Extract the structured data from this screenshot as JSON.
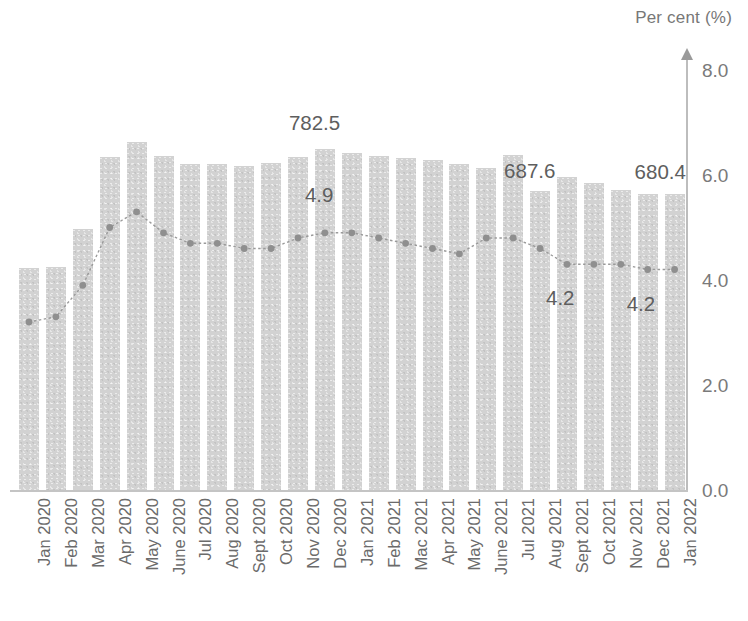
{
  "chart": {
    "y_axis_title": "Per cent (%)",
    "y_ticks": [
      "8.0",
      "6.0",
      "4.0",
      "2.0",
      "0.0"
    ]
  },
  "chart_data": {
    "type": "bar",
    "title": "",
    "subtitle": "",
    "xlabel": "",
    "ylabel": "Per cent (%)",
    "ylim": [
      0.0,
      8.0
    ],
    "yticks": [
      0.0,
      2.0,
      4.0,
      6.0,
      8.0
    ],
    "grid": false,
    "legend": null,
    "categories": [
      "Jan 2020",
      "Feb 2020",
      "Mar 2020",
      "Apr 2020",
      "May 2020",
      "June 2020",
      "Jul 2020",
      "Aug 2020",
      "Sept 2020",
      "Oct 2020",
      "Nov 2020",
      "Dec 2020",
      "Jan 2021",
      "Feb 2021",
      "Mac 2021",
      "Apr 2021",
      "May 2021",
      "June 2021",
      "Jul 2021",
      "Aug 2021",
      "Sept 2021",
      "Oct 2021",
      "Nov 2021",
      "Dec 2021",
      "Jan 2022"
    ],
    "series": [
      {
        "name": "Number (thousand)",
        "type": "bar",
        "axis": "left-hidden",
        "color": "#d2d2d2",
        "values": [
          510.0,
          512.0,
          600.0,
          765.0,
          800.0,
          768.0,
          750.0,
          750.0,
          745.0,
          752.0,
          765.0,
          782.5,
          775.0,
          768.0,
          762.0,
          758.0,
          750.0,
          740.0,
          770.0,
          687.6,
          720.0,
          705.0,
          690.0,
          680.0,
          680.4
        ],
        "labeled_points": [
          {
            "category": "Dec 2020",
            "label": "782.5"
          },
          {
            "category": "Aug 2021",
            "label": "687.6"
          },
          {
            "category": "Jan 2022",
            "label": "680.4"
          }
        ]
      },
      {
        "name": "Unemployment rate (%)",
        "type": "line",
        "axis": "right",
        "color": "#9a9a9a",
        "values": [
          3.2,
          3.3,
          3.9,
          5.0,
          5.3,
          4.9,
          4.7,
          4.7,
          4.6,
          4.6,
          4.8,
          4.9,
          4.9,
          4.8,
          4.7,
          4.6,
          4.5,
          4.8,
          4.8,
          4.6,
          4.3,
          4.3,
          4.3,
          4.2,
          4.2
        ],
        "labeled_points": [
          {
            "category": "Dec 2020",
            "label": "4.9"
          },
          {
            "category": "Sept 2021",
            "label": "4.2"
          },
          {
            "category": "Dec 2021",
            "label": "4.2"
          }
        ]
      }
    ],
    "annotations": [
      {
        "text": "782.5",
        "x_category": "Dec 2020",
        "series": "bar"
      },
      {
        "text": "4.9",
        "x_category": "Dec 2020",
        "series": "line"
      },
      {
        "text": "687.6",
        "x_category": "Aug 2021",
        "series": "bar"
      },
      {
        "text": "4.2",
        "x_category": "Sept 2021",
        "series": "line"
      },
      {
        "text": "680.4",
        "x_category": "Jan 2022",
        "series": "bar"
      },
      {
        "text": "4.2",
        "x_category": "Dec 2021",
        "series": "line"
      }
    ]
  }
}
